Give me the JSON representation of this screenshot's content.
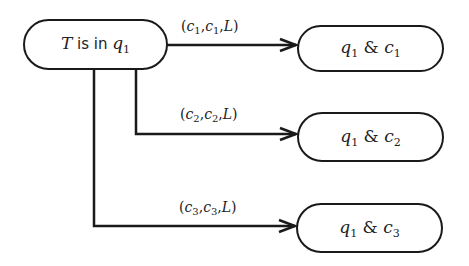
{
  "diagram": {
    "type": "flowchart",
    "source_node": {
      "id": "source",
      "var": "T",
      "middle": " is in ",
      "state": "q",
      "state_sub": "1"
    },
    "target_nodes": [
      {
        "id": "t1",
        "state": "q",
        "state_sub": "1",
        "amp": " & ",
        "sym": "c",
        "sym_sub": "1"
      },
      {
        "id": "t2",
        "state": "q",
        "state_sub": "1",
        "amp": " & ",
        "sym": "c",
        "sym_sub": "2"
      },
      {
        "id": "t3",
        "state": "q",
        "state_sub": "1",
        "amp": " & ",
        "sym": "c",
        "sym_sub": "3"
      }
    ],
    "edges": [
      {
        "from": "source",
        "to": "t1",
        "open": "(",
        "a": "c",
        "a_sub": "1",
        "b": "c",
        "b_sub": "1",
        "dir": "L",
        "close": ")",
        "comma": ","
      },
      {
        "from": "source",
        "to": "t2",
        "open": "(",
        "a": "c",
        "a_sub": "2",
        "b": "c",
        "b_sub": "2",
        "dir": "L",
        "close": ")",
        "comma": ","
      },
      {
        "from": "source",
        "to": "t3",
        "open": "(",
        "a": "c",
        "a_sub": "3",
        "b": "c",
        "b_sub": "3",
        "dir": "L",
        "close": ")",
        "comma": ","
      }
    ]
  }
}
